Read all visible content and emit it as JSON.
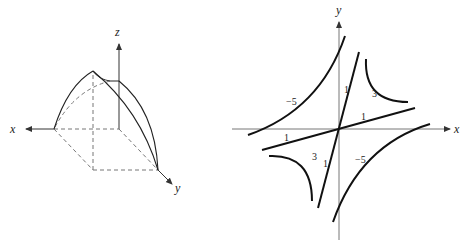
{
  "left_figure": {
    "description": "3D surface patch over a rectangular base in the first octant",
    "axes": {
      "x_label": "x",
      "y_label": "y",
      "z_label": "z"
    }
  },
  "right_figure": {
    "description": "Level curves of a function (hyperbola-like contours)",
    "axes": {
      "x_label": "x",
      "y_label": "y"
    },
    "contour_labels": {
      "neg5_upper_left": "−5",
      "neg5_lower_right": "−5",
      "three_upper_right": "3",
      "three_lower_left": "3",
      "one_steep_upper": "1",
      "one_steep_lower": "1",
      "one_shallow_right": "1",
      "one_shallow_left": "1"
    }
  },
  "colors": {
    "ink": "#222222",
    "axis": "#555555",
    "dash": "#666666"
  }
}
